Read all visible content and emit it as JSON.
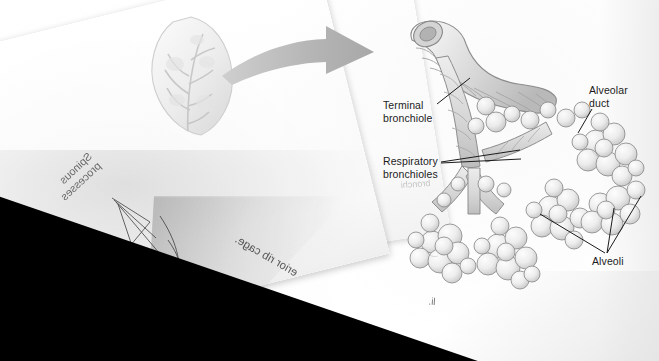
{
  "page": {
    "kind": "scanned-anatomy-textbook-page",
    "background_color": "#ffffff",
    "void_color": "#000000",
    "ink_color": "#1c1c1c"
  },
  "labels": {
    "terminal_bronchiole": "Terminal\nbronchiole",
    "terminal_bronchiole_line1": "Terminal",
    "terminal_bronchiole_line2": "bronchiole",
    "respiratory_bronchioles_line1": "Respiratory",
    "respiratory_bronchioles_line2": "bronchioles",
    "alveolar_duct_line1": "Alveolar",
    "alveolar_duct_line2": "duct",
    "alveoli": "Alveoli"
  },
  "showthrough": {
    "note": "mirrored text bleeding through from the reverse side of the underlying page",
    "spinous_line1": "Spinous",
    "spinous_line2": "processes",
    "scapula": "Scapula",
    "rib_cage": "erior rib cage.",
    "bronchioles_faint": "bronchi",
    "fragment": "li."
  },
  "illustration": {
    "inset_name": "lung-cross-section-inset",
    "arrow_name": "magnification-arrow",
    "tree_name": "bronchiole-alveoli-tree",
    "stroke_color": "#5a5a5a",
    "fill_light": "#f2f2f2",
    "fill_mid": "#dcdcdc",
    "fill_dark": "#bdbdbd",
    "arrow_color": "#b3b3b3"
  }
}
